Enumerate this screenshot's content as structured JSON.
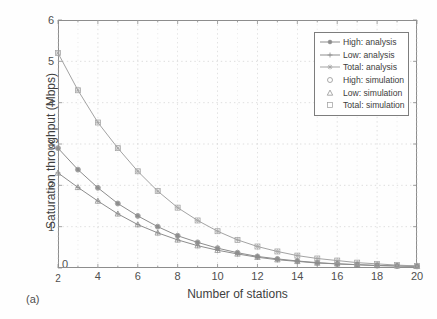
{
  "figure": {
    "panel_label": "(a)"
  },
  "chart_data": {
    "type": "line",
    "title": "",
    "xlabel": "Number of stations",
    "ylabel": "Saturation throughput (Mbps)",
    "xlim": [
      2,
      20
    ],
    "ylim": [
      0,
      6
    ],
    "xticks": [
      2,
      4,
      6,
      8,
      10,
      12,
      14,
      16,
      18,
      20
    ],
    "xticklabels": [
      "2",
      "4",
      "6",
      "8",
      "10",
      "12",
      "14",
      "16",
      "18",
      "20"
    ],
    "yticks": [
      0,
      1,
      2,
      3,
      4,
      5,
      6
    ],
    "yticklabels": [
      "0",
      "1",
      "2",
      "3",
      "4",
      "5",
      "6"
    ],
    "grid": true,
    "grid_style": "dotted",
    "legend_position": "upper right",
    "x": [
      2,
      3,
      4,
      5,
      6,
      7,
      8,
      9,
      10,
      11,
      12,
      13,
      14,
      15,
      16,
      17,
      18,
      19,
      20
    ],
    "series": [
      {
        "name": "High: analysis",
        "marker": "filled-circle",
        "line": "solid",
        "color": "#8d8d8d",
        "values": [
          2.9,
          2.38,
          1.94,
          1.56,
          1.26,
          1.0,
          0.78,
          0.62,
          0.48,
          0.37,
          0.28,
          0.22,
          0.17,
          0.13,
          0.1,
          0.08,
          0.06,
          0.05,
          0.04
        ]
      },
      {
        "name": "Low: analysis",
        "marker": "plus",
        "line": "solid",
        "color": "#8d8d8d",
        "values": [
          2.3,
          1.95,
          1.62,
          1.31,
          1.05,
          0.85,
          0.68,
          0.54,
          0.43,
          0.34,
          0.26,
          0.2,
          0.16,
          0.12,
          0.1,
          0.08,
          0.06,
          0.05,
          0.04
        ]
      },
      {
        "name": "Total: analysis",
        "marker": "star",
        "line": "solid",
        "color": "#a3a3a3",
        "values": [
          5.2,
          4.3,
          3.52,
          2.9,
          2.34,
          1.86,
          1.46,
          1.15,
          0.89,
          0.68,
          0.52,
          0.4,
          0.3,
          0.23,
          0.18,
          0.13,
          0.1,
          0.07,
          0.05
        ]
      },
      {
        "name": "High: simulation",
        "marker": "open-circle",
        "line": "none",
        "color": "#8d8d8d",
        "values": [
          2.9,
          2.38,
          1.94,
          1.56,
          1.26,
          1.0,
          0.78,
          0.62,
          0.48,
          0.37,
          0.28,
          0.22,
          0.17,
          0.13,
          0.1,
          0.08,
          0.06,
          0.05,
          0.04
        ]
      },
      {
        "name": "Low: simulation",
        "marker": "open-triangle",
        "line": "none",
        "color": "#8d8d8d",
        "values": [
          2.3,
          1.95,
          1.62,
          1.31,
          1.05,
          0.85,
          0.68,
          0.54,
          0.43,
          0.34,
          0.26,
          0.2,
          0.16,
          0.12,
          0.1,
          0.08,
          0.06,
          0.05,
          0.04
        ]
      },
      {
        "name": "Total: simulation",
        "marker": "open-square",
        "line": "none",
        "color": "#a3a3a3",
        "values": [
          5.2,
          4.3,
          3.52,
          2.9,
          2.34,
          1.86,
          1.46,
          1.15,
          0.89,
          0.68,
          0.52,
          0.4,
          0.3,
          0.23,
          0.18,
          0.13,
          0.1,
          0.07,
          0.05
        ]
      }
    ],
    "legend": [
      {
        "label": "High: analysis",
        "marker": "filled-circle",
        "line": true,
        "color": "#8d8d8d"
      },
      {
        "label": "Low: analysis",
        "marker": "plus",
        "line": true,
        "color": "#8d8d8d"
      },
      {
        "label": "Total: analysis",
        "marker": "star",
        "line": true,
        "color": "#a3a3a3"
      },
      {
        "label": "High: simulation",
        "marker": "open-circle",
        "line": false,
        "color": "#8d8d8d"
      },
      {
        "label": "Low: simulation",
        "marker": "open-triangle",
        "line": false,
        "color": "#8d8d8d"
      },
      {
        "label": "Total: simulation",
        "marker": "open-square",
        "line": false,
        "color": "#a3a3a3"
      }
    ],
    "colors": {
      "axis": "#8d8d8d",
      "grid": "#c9c9c9",
      "text": "#4a4a4a",
      "background": "#fefefe"
    }
  }
}
